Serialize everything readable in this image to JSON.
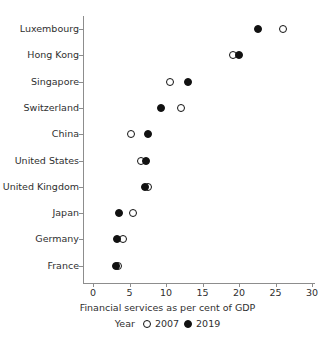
{
  "chart_data": {
    "type": "scatter",
    "title": "",
    "xlabel": "Financial services as per cent of GDP",
    "ylabel": "",
    "xlim": [
      0,
      31
    ],
    "ylim_categories": [
      "Luxembourg",
      "Hong Kong",
      "Singapore",
      "Switzerland",
      "China",
      "United States",
      "United Kingdom",
      "Japan",
      "Germany",
      "France"
    ],
    "categories": [
      "Luxembourg",
      "Hong Kong",
      "Singapore",
      "Switzerland",
      "China",
      "United States",
      "United Kingdom",
      "Japan",
      "Germany",
      "France"
    ],
    "xticks": [
      0,
      5,
      10,
      15,
      20,
      25,
      30
    ],
    "xtick_labels": [
      "0",
      "5",
      "10",
      "15",
      "20",
      "25",
      "30"
    ],
    "grid": false,
    "legend_position": "bottom",
    "legend_title": "Year",
    "series": [
      {
        "name": "2007",
        "marker": "open-circle",
        "color": "#111111",
        "values": [
          26.0,
          19.2,
          10.5,
          12.0,
          5.2,
          6.6,
          7.6,
          5.5,
          4.1,
          3.4
        ]
      },
      {
        "name": "2019",
        "marker": "filled-circle",
        "color": "#111111",
        "values": [
          22.6,
          20.0,
          13.0,
          9.3,
          7.5,
          7.2,
          7.1,
          3.6,
          3.3,
          3.1
        ]
      }
    ]
  },
  "axis": {
    "x_title": "Financial services as per cent of GDP"
  },
  "legend": {
    "title": "Year",
    "items": [
      {
        "label": "2007",
        "marker": "open-circle"
      },
      {
        "label": "2019",
        "marker": "filled-circle"
      }
    ]
  }
}
